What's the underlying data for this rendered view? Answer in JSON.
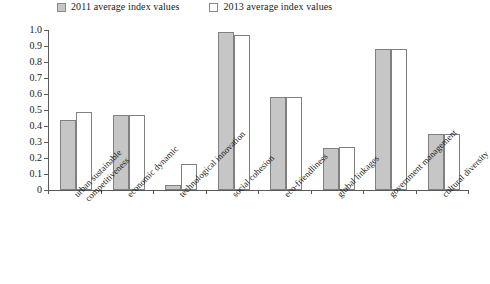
{
  "legend": {
    "entries": [
      {
        "label": "2011 average index values",
        "swatch": "filled",
        "color": "#c6c6c6"
      },
      {
        "label": "2013 average index values",
        "swatch": "hollow",
        "color": "#ffffff"
      }
    ]
  },
  "axis": {
    "y_ticks": [
      "1.0",
      "0.9",
      "0.8",
      "0.7",
      "0.6",
      "0.5",
      "0.4",
      "0.3",
      "0.2",
      "0.1",
      "0"
    ]
  },
  "chart_data": {
    "type": "bar",
    "title": "",
    "xlabel": "",
    "ylabel": "",
    "ylim": [
      0,
      1.0
    ],
    "ytick_step": 0.1,
    "grid": false,
    "legend_position": "top-left",
    "categories": [
      "urban sustainable competitiveness",
      "economic dynamic",
      "technological innovation",
      "social cohesion",
      "eco-friendliness",
      "global linkages",
      "government management",
      "cultural diversity"
    ],
    "category_lines": [
      [
        "urban sustainable",
        "competitiveness"
      ],
      [
        "economic dynamic"
      ],
      [
        "technological innovation"
      ],
      [
        "social cohesion"
      ],
      [
        "eco-friendliness"
      ],
      [
        "global linkages"
      ],
      [
        "government management"
      ],
      [
        "cultural diversity"
      ]
    ],
    "series": [
      {
        "name": "2011 average index values",
        "color": "#c6c6c6",
        "values": [
          0.44,
          0.47,
          0.03,
          0.99,
          0.58,
          0.26,
          0.88,
          0.35
        ]
      },
      {
        "name": "2013 average index values",
        "color": "#ffffff",
        "values": [
          0.49,
          0.47,
          0.16,
          0.97,
          0.58,
          0.27,
          0.88,
          0.35
        ]
      }
    ]
  }
}
